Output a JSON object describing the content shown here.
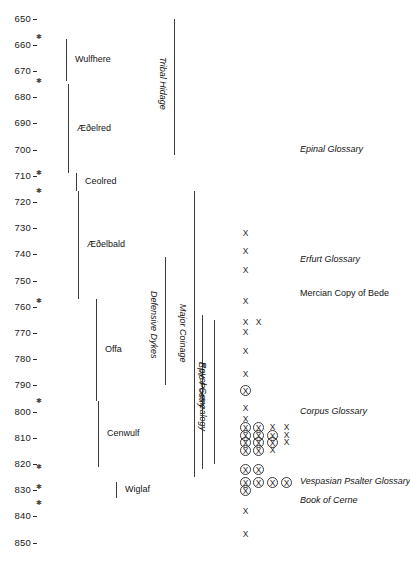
{
  "chart_data": {
    "type": "timeline",
    "title": "",
    "xlabel": "",
    "ylabel": "Year AD",
    "ylim": [
      645,
      855
    ],
    "grid": false,
    "legend": "none",
    "axis": {
      "orientation": "vertical",
      "tick_step": 10,
      "tick_labels": [
        "650",
        "660",
        "670",
        "680",
        "690",
        "700",
        "710",
        "720",
        "730",
        "740",
        "750",
        "760",
        "770",
        "780",
        "790",
        "800",
        "810",
        "820",
        "830",
        "840",
        "850"
      ],
      "tick_values": [
        650,
        660,
        670,
        680,
        690,
        700,
        710,
        720,
        730,
        740,
        750,
        760,
        770,
        780,
        790,
        800,
        810,
        820,
        830,
        840,
        850
      ]
    },
    "star_markers": {
      "description": "small asterisk marks beside the year axis",
      "years": [
        657,
        674,
        709,
        716,
        758,
        796,
        821,
        829,
        835
      ]
    },
    "reign_spans": [
      {
        "label": "Wulfhere",
        "start": 658,
        "end": 674
      },
      {
        "label": "Æðelred",
        "start": 675,
        "end": 709
      },
      {
        "label": "Ceolred",
        "start": 709,
        "end": 716
      },
      {
        "label": "Æðelbald",
        "start": 716,
        "end": 757
      },
      {
        "label": "Offa",
        "start": 757,
        "end": 796
      },
      {
        "label": "Cenwulf",
        "start": 796,
        "end": 821
      },
      {
        "label": "Wiglaf",
        "start": 827,
        "end": 833
      }
    ],
    "theme_spans": [
      {
        "label": "Tribal Hidage",
        "start": 650,
        "end": 702,
        "rotated": true
      },
      {
        "label": "Major Coinage",
        "start": 716,
        "end": 825,
        "rotated": true
      },
      {
        "label": "Defensive Dykes",
        "start": 741,
        "end": 790,
        "rotated": true
      },
      {
        "label": "Royal Genealogy",
        "start": 765,
        "end": 820,
        "rotated": true
      },
      {
        "label": "Epic Poetry",
        "start": 763,
        "end": 822,
        "rotated": true
      }
    ],
    "manuscript_labels": [
      {
        "label": "Epinal Glossary",
        "year": 700,
        "style": "italic"
      },
      {
        "label": "Erfurt Glossary",
        "year": 742,
        "style": "italic"
      },
      {
        "label": "Mercian Copy of Bede",
        "year": 755,
        "style": "plain"
      },
      {
        "label": "Corpus Glossary",
        "year": 800,
        "style": "italic"
      },
      {
        "label": "Vespasian Psalter Glossary",
        "year": 827,
        "style": "italic"
      },
      {
        "label": "Book of Cerne",
        "year": 834,
        "style": "italic"
      }
    ],
    "manuscript_marks": {
      "description": "X = manuscript; circled X = manuscript with Mercian features. Column index 0 is leftmost.",
      "symbol_plain": "X",
      "symbol_circled": "X",
      "rows": [
        {
          "year": 732,
          "marks": [
            {
              "col": 0,
              "circled": false
            }
          ]
        },
        {
          "year": 739,
          "marks": [
            {
              "col": 0,
              "circled": false
            }
          ]
        },
        {
          "year": 746,
          "marks": [
            {
              "col": 0,
              "circled": false
            }
          ]
        },
        {
          "year": 758,
          "marks": [
            {
              "col": 0,
              "circled": false
            }
          ]
        },
        {
          "year": 766,
          "marks": [
            {
              "col": 0,
              "circled": false
            },
            {
              "col": 1,
              "circled": false
            }
          ]
        },
        {
          "year": 770,
          "marks": [
            {
              "col": 0,
              "circled": false
            }
          ]
        },
        {
          "year": 777,
          "marks": [
            {
              "col": 0,
              "circled": false
            }
          ]
        },
        {
          "year": 786,
          "marks": [
            {
              "col": 0,
              "circled": false
            }
          ]
        },
        {
          "year": 792,
          "marks": [
            {
              "col": 0,
              "circled": true
            }
          ]
        },
        {
          "year": 799,
          "marks": [
            {
              "col": 0,
              "circled": false
            }
          ]
        },
        {
          "year": 803,
          "marks": [
            {
              "col": 0,
              "circled": false
            }
          ]
        },
        {
          "year": 806,
          "marks": [
            {
              "col": 0,
              "circled": true
            },
            {
              "col": 1,
              "circled": true
            },
            {
              "col": 2,
              "circled": false
            },
            {
              "col": 3,
              "circled": false
            }
          ]
        },
        {
          "year": 809,
          "marks": [
            {
              "col": 0,
              "circled": true
            },
            {
              "col": 1,
              "circled": true
            },
            {
              "col": 2,
              "circled": true
            },
            {
              "col": 3,
              "circled": false
            }
          ]
        },
        {
          "year": 812,
          "marks": [
            {
              "col": 0,
              "circled": true
            },
            {
              "col": 1,
              "circled": true
            },
            {
              "col": 2,
              "circled": true
            },
            {
              "col": 3,
              "circled": false
            }
          ]
        },
        {
          "year": 815,
          "marks": [
            {
              "col": 0,
              "circled": true
            },
            {
              "col": 1,
              "circled": true
            },
            {
              "col": 2,
              "circled": false
            }
          ]
        },
        {
          "year": 822,
          "marks": [
            {
              "col": 0,
              "circled": true
            },
            {
              "col": 1,
              "circled": true
            }
          ]
        },
        {
          "year": 827,
          "marks": [
            {
              "col": 0,
              "circled": true
            },
            {
              "col": 1,
              "circled": true
            },
            {
              "col": 2,
              "circled": true
            },
            {
              "col": 3,
              "circled": true
            }
          ]
        },
        {
          "year": 830,
          "marks": [
            {
              "col": 0,
              "circled": true
            }
          ]
        },
        {
          "year": 838,
          "marks": [
            {
              "col": 0,
              "circled": false
            }
          ]
        },
        {
          "year": 847,
          "marks": [
            {
              "col": 0,
              "circled": false
            }
          ]
        }
      ]
    },
    "colors": {
      "background": "#ffffff",
      "line": "#3a3a3a",
      "text": "#141414"
    }
  }
}
